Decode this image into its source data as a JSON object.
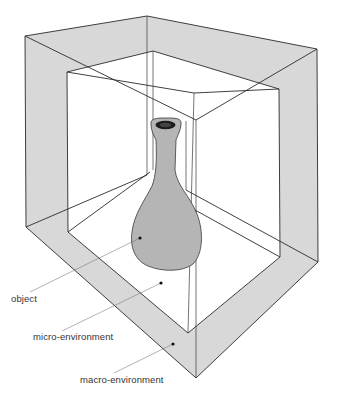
{
  "diagram": {
    "type": "nested-enclosure-illustration",
    "colors": {
      "macro_shell": "#d8d8d8",
      "object_fill": "#b5b5b5",
      "line": "#2a2a2a",
      "label_text": "#333333"
    },
    "labels": [
      {
        "id": "object",
        "text": "object"
      },
      {
        "id": "micro",
        "text": "micro-environment"
      },
      {
        "id": "macro",
        "text": "macro-environment"
      }
    ]
  }
}
